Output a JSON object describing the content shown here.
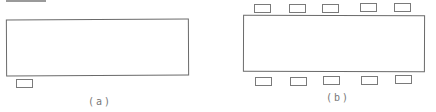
{
  "diagram": {
    "panels": [
      {
        "id": "a",
        "label": "(a)",
        "main_rect": {
          "x": 6,
          "y": 19,
          "w": 183,
          "h": 57
        },
        "small_rects": [
          {
            "x": 16,
            "y": 79
          }
        ]
      },
      {
        "id": "b",
        "label": "(b)",
        "main_rect": {
          "x": 243,
          "y": 15,
          "w": 182,
          "h": 57
        },
        "small_rects_top": [
          {
            "x": 254,
            "y": 3
          },
          {
            "x": 289,
            "y": 3
          },
          {
            "x": 322,
            "y": 3
          },
          {
            "x": 360,
            "y": 3
          },
          {
            "x": 394,
            "y": 3
          }
        ],
        "small_rects_bottom": [
          {
            "x": 255,
            "y": 76
          },
          {
            "x": 290,
            "y": 76
          },
          {
            "x": 323,
            "y": 76
          },
          {
            "x": 361,
            "y": 76
          },
          {
            "x": 395,
            "y": 76
          }
        ]
      }
    ],
    "colors": {
      "stroke": "#6a6a6a",
      "label": "#777777"
    }
  }
}
